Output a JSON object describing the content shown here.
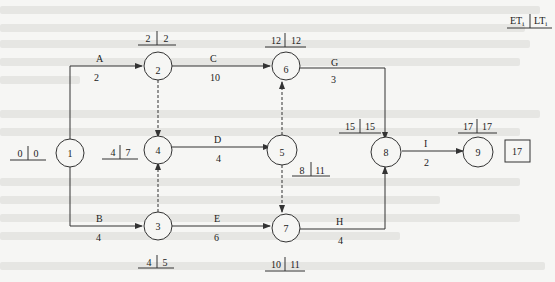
{
  "legend": {
    "left": "ET",
    "left_sub": "i",
    "right": "LT",
    "right_sub": "i"
  },
  "total_duration_box": "17",
  "nodes": [
    {
      "id": "1",
      "label": "1",
      "et": "0",
      "lt": "0"
    },
    {
      "id": "2",
      "label": "2",
      "et": "2",
      "lt": "2"
    },
    {
      "id": "3",
      "label": "3",
      "et": "4",
      "lt": "5"
    },
    {
      "id": "4",
      "label": "4",
      "et": "4",
      "lt": "7"
    },
    {
      "id": "5",
      "label": "5",
      "et": "8",
      "lt": "11"
    },
    {
      "id": "6",
      "label": "6",
      "et": "12",
      "lt": "12"
    },
    {
      "id": "7",
      "label": "7",
      "et": "10",
      "lt": "11"
    },
    {
      "id": "8",
      "label": "8",
      "et": "15",
      "lt": "15"
    },
    {
      "id": "9",
      "label": "9",
      "et": "17",
      "lt": "17"
    }
  ],
  "activities": [
    {
      "name": "A",
      "duration": "2",
      "from": "1",
      "to": "2"
    },
    {
      "name": "B",
      "duration": "4",
      "from": "1",
      "to": "3"
    },
    {
      "name": "C",
      "duration": "10",
      "from": "2",
      "to": "6"
    },
    {
      "name": "D",
      "duration": "4",
      "from": "4",
      "to": "5"
    },
    {
      "name": "E",
      "duration": "6",
      "from": "3",
      "to": "7"
    },
    {
      "name": "G",
      "duration": "3",
      "from": "6",
      "to": "8"
    },
    {
      "name": "H",
      "duration": "4",
      "from": "7",
      "to": "8"
    },
    {
      "name": "I",
      "duration": "2",
      "from": "8",
      "to": "9"
    }
  ],
  "dummy_activities": [
    {
      "from": "2",
      "to": "4"
    },
    {
      "from": "3",
      "to": "4"
    },
    {
      "from": "5",
      "to": "6"
    },
    {
      "from": "5",
      "to": "7"
    }
  ]
}
